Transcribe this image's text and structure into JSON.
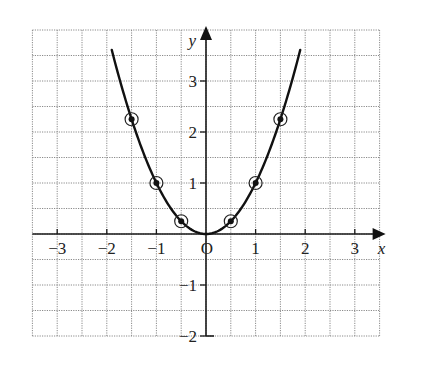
{
  "chart_data": {
    "type": "line",
    "title": "",
    "function": "y = x^2",
    "xlabel": "x",
    "ylabel": "y",
    "origin_label": "O",
    "xlim": [
      -3.5,
      3.5
    ],
    "ylim": [
      -2,
      4
    ],
    "grid": true,
    "grid_step": 0.5,
    "x_ticks": [
      {
        "value": -3,
        "label": "−3"
      },
      {
        "value": -2,
        "label": "−2"
      },
      {
        "value": -1,
        "label": "−1"
      },
      {
        "value": 1,
        "label": "1"
      },
      {
        "value": 2,
        "label": "2"
      },
      {
        "value": 3,
        "label": "3"
      }
    ],
    "y_ticks": [
      {
        "value": 3,
        "label": "3"
      },
      {
        "value": 2,
        "label": "2"
      },
      {
        "value": 1,
        "label": "1"
      },
      {
        "value": -1,
        "label": "−1"
      },
      {
        "value": -2,
        "label": "−2"
      }
    ],
    "curve_domain": [
      -1.9,
      1.9
    ],
    "series": [
      {
        "name": "plotted points",
        "points": [
          {
            "x": -1.5,
            "y": 2.25
          },
          {
            "x": -1,
            "y": 1
          },
          {
            "x": -0.5,
            "y": 0.25
          },
          {
            "x": 0.5,
            "y": 0.25
          },
          {
            "x": 1,
            "y": 1
          },
          {
            "x": 1.5,
            "y": 2.25
          }
        ]
      }
    ]
  }
}
